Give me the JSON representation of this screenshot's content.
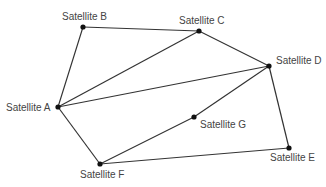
{
  "diagram": {
    "type": "network-graph",
    "nodes": [
      {
        "id": "A",
        "label": "Satellite A",
        "x": 58,
        "y": 107,
        "lx": 6,
        "ly": 111,
        "anchor": "start"
      },
      {
        "id": "B",
        "label": "Satellite B",
        "x": 83,
        "y": 27,
        "lx": 62,
        "ly": 20,
        "anchor": "start"
      },
      {
        "id": "C",
        "label": "Satellite C",
        "x": 199,
        "y": 31,
        "lx": 179,
        "ly": 24,
        "anchor": "start"
      },
      {
        "id": "D",
        "label": "Satellite D",
        "x": 269,
        "y": 66,
        "lx": 276,
        "ly": 64,
        "anchor": "start"
      },
      {
        "id": "E",
        "label": "Satellite E",
        "x": 289,
        "y": 148,
        "lx": 270,
        "ly": 161,
        "anchor": "start"
      },
      {
        "id": "F",
        "label": "Satellite F",
        "x": 100,
        "y": 164,
        "lx": 80,
        "ly": 178,
        "anchor": "start"
      },
      {
        "id": "G",
        "label": "Satellite G",
        "x": 194,
        "y": 117,
        "lx": 200,
        "ly": 128,
        "anchor": "start"
      }
    ],
    "edges": [
      [
        "A",
        "B"
      ],
      [
        "B",
        "C"
      ],
      [
        "A",
        "C"
      ],
      [
        "C",
        "D"
      ],
      [
        "A",
        "D"
      ],
      [
        "A",
        "F"
      ],
      [
        "F",
        "G"
      ],
      [
        "G",
        "D"
      ],
      [
        "F",
        "E"
      ],
      [
        "D",
        "E"
      ]
    ],
    "colors": {
      "edge": "#333333",
      "node": "#111111",
      "label": "#444444",
      "background": "#ffffff"
    }
  }
}
